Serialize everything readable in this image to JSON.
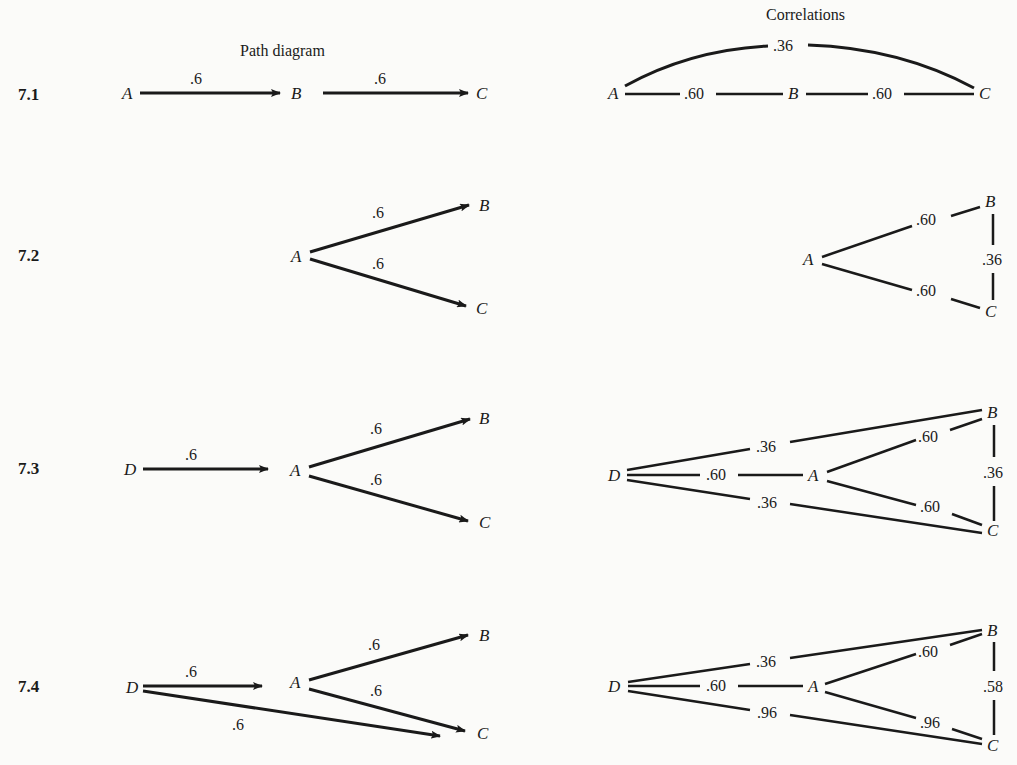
{
  "headers": {
    "left": "Path diagram",
    "right": "Correlations"
  },
  "figures": [
    {
      "id": "7.1",
      "path": {
        "nodes": [
          "A",
          "B",
          "C"
        ],
        "edges": [
          {
            "from": "A",
            "to": "B",
            "label": ".6"
          },
          {
            "from": "B",
            "to": "C",
            "label": ".6"
          }
        ]
      },
      "corr": {
        "nodes": [
          "A",
          "B",
          "C"
        ],
        "edges": [
          {
            "from": "A",
            "to": "B",
            "label": ".60"
          },
          {
            "from": "B",
            "to": "C",
            "label": ".60"
          },
          {
            "from": "A",
            "to": "C",
            "label": ".36"
          }
        ]
      }
    },
    {
      "id": "7.2",
      "path": {
        "nodes": [
          "A",
          "B",
          "C"
        ],
        "edges": [
          {
            "from": "A",
            "to": "B",
            "label": ".6"
          },
          {
            "from": "A",
            "to": "C",
            "label": ".6"
          }
        ]
      },
      "corr": {
        "nodes": [
          "A",
          "B",
          "C"
        ],
        "edges": [
          {
            "from": "A",
            "to": "B",
            "label": ".60"
          },
          {
            "from": "A",
            "to": "C",
            "label": ".60"
          },
          {
            "from": "B",
            "to": "C",
            "label": ".36"
          }
        ]
      }
    },
    {
      "id": "7.3",
      "path": {
        "nodes": [
          "D",
          "A",
          "B",
          "C"
        ],
        "edges": [
          {
            "from": "D",
            "to": "A",
            "label": ".6"
          },
          {
            "from": "A",
            "to": "B",
            "label": ".6"
          },
          {
            "from": "A",
            "to": "C",
            "label": ".6"
          }
        ]
      },
      "corr": {
        "nodes": [
          "D",
          "A",
          "B",
          "C"
        ],
        "edges": [
          {
            "from": "D",
            "to": "B",
            "label": ".36"
          },
          {
            "from": "D",
            "to": "A",
            "label": ".60"
          },
          {
            "from": "D",
            "to": "C",
            "label": ".36"
          },
          {
            "from": "A",
            "to": "B",
            "label": ".60"
          },
          {
            "from": "A",
            "to": "C",
            "label": ".60"
          },
          {
            "from": "B",
            "to": "C",
            "label": ".36"
          }
        ]
      }
    },
    {
      "id": "7.4",
      "path": {
        "nodes": [
          "D",
          "A",
          "B",
          "C"
        ],
        "edges": [
          {
            "from": "D",
            "to": "A",
            "label": ".6"
          },
          {
            "from": "A",
            "to": "B",
            "label": ".6"
          },
          {
            "from": "A",
            "to": "C",
            "label": ".6"
          },
          {
            "from": "D",
            "to": "C",
            "label": ".6"
          }
        ]
      },
      "corr": {
        "nodes": [
          "D",
          "A",
          "B",
          "C"
        ],
        "edges": [
          {
            "from": "D",
            "to": "B",
            "label": ".36"
          },
          {
            "from": "D",
            "to": "A",
            "label": ".60"
          },
          {
            "from": "D",
            "to": "C",
            "label": ".96"
          },
          {
            "from": "A",
            "to": "B",
            "label": ".60"
          },
          {
            "from": "A",
            "to": "C",
            "label": ".96"
          },
          {
            "from": "B",
            "to": "C",
            "label": ".58"
          }
        ]
      }
    }
  ]
}
